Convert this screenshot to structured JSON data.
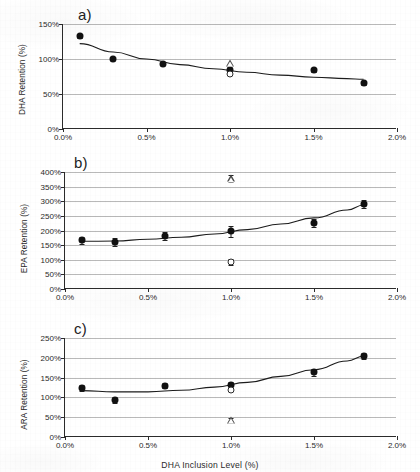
{
  "figure": {
    "xlabel": "DHA Inclusion Level (%)",
    "panel_tags": [
      "a)",
      "b)",
      "c)"
    ]
  },
  "chart_data": [
    {
      "type": "scatter",
      "panel": "a)",
      "title": "",
      "xlabel": "DHA Inclusion Level (%)",
      "ylabel": "DHA Retention (%)",
      "xlim": [
        0,
        2.0
      ],
      "ylim": [
        0,
        150
      ],
      "xticks": [
        0.0,
        0.5,
        1.0,
        1.5,
        2.0
      ],
      "xtick_labels": [
        "0.0%",
        "0.5%",
        "1.0%",
        "1.5%",
        "2.0%"
      ],
      "yticks": [
        0,
        50,
        100,
        150
      ],
      "ytick_labels": [
        "0%",
        "50%",
        "100%",
        "150%"
      ],
      "grid": true,
      "legend": "none",
      "series": [
        {
          "name": "Mean retention (filled circle)",
          "marker": "filled-circle",
          "x": [
            0.1,
            0.3,
            0.6,
            1.0,
            1.5,
            1.8
          ],
          "values": [
            133,
            100,
            93,
            84,
            84,
            66
          ],
          "yerr": [
            3,
            2,
            2,
            4,
            2,
            3
          ]
        },
        {
          "name": "Outlier replicate (open circle)",
          "marker": "open-circle",
          "x": [
            1.0
          ],
          "values": [
            79
          ]
        },
        {
          "name": "Outlier replicate (open triangle)",
          "marker": "open-triangle",
          "x": [
            1.0
          ],
          "values": [
            95
          ]
        }
      ],
      "fit_curve": {
        "name": "fitted trend",
        "x": [
          0.1,
          0.3,
          0.5,
          0.7,
          0.9,
          1.1,
          1.3,
          1.5,
          1.7,
          1.8
        ],
        "y": [
          122,
          110,
          100,
          92,
          86,
          81,
          77,
          74,
          72,
          71
        ]
      }
    },
    {
      "type": "scatter",
      "panel": "b)",
      "title": "",
      "xlabel": "DHA Inclusion Level (%)",
      "ylabel": "EPA Retention (%)",
      "xlim": [
        0,
        2.0
      ],
      "ylim": [
        0,
        400
      ],
      "xticks": [
        0.0,
        0.5,
        1.0,
        1.5,
        2.0
      ],
      "xtick_labels": [
        "0.0%",
        "0.5%",
        "1.0%",
        "1.5%",
        "2.0%"
      ],
      "yticks": [
        0,
        50,
        100,
        150,
        200,
        250,
        300,
        350,
        400
      ],
      "ytick_labels": [
        "0%",
        "50%",
        "100%",
        "150%",
        "200%",
        "250%",
        "300%",
        "350%",
        "400%"
      ],
      "grid": true,
      "legend": "none",
      "series": [
        {
          "name": "Mean retention (filled circle)",
          "marker": "filled-circle",
          "x": [
            0.1,
            0.3,
            0.6,
            1.0,
            1.5,
            1.8
          ],
          "values": [
            166,
            161,
            181,
            197,
            227,
            290
          ],
          "yerr": [
            12,
            13,
            14,
            18,
            14,
            13
          ]
        },
        {
          "name": "Outlier replicate (open circle)",
          "marker": "open-circle",
          "x": [
            1.0
          ],
          "values": [
            92
          ],
          "yerr": [
            10
          ]
        },
        {
          "name": "Outlier replicate (open triangle)",
          "marker": "open-triangle",
          "x": [
            1.0
          ],
          "values": [
            378
          ],
          "yerr": [
            12
          ]
        }
      ],
      "fit_curve": {
        "name": "fitted trend",
        "x": [
          0.1,
          0.3,
          0.5,
          0.7,
          0.9,
          1.1,
          1.3,
          1.5,
          1.7,
          1.8
        ],
        "y": [
          163,
          164,
          170,
          177,
          188,
          203,
          222,
          243,
          270,
          287
        ]
      }
    },
    {
      "type": "scatter",
      "panel": "c)",
      "title": "",
      "xlabel": "DHA Inclusion Level (%)",
      "ylabel": "ARA Retention (%)",
      "xlim": [
        0,
        2.0
      ],
      "ylim": [
        0,
        250
      ],
      "xticks": [
        0.0,
        0.5,
        1.0,
        1.5,
        2.0
      ],
      "xtick_labels": [
        "0.0%",
        "0.5%",
        "1.0%",
        "1.5%",
        "2.0%"
      ],
      "yticks": [
        0,
        50,
        100,
        150,
        200,
        250
      ],
      "ytick_labels": [
        "0%",
        "50%",
        "100%",
        "150%",
        "200%",
        "250%"
      ],
      "grid": true,
      "legend": "none",
      "series": [
        {
          "name": "Mean retention (filled circle)",
          "marker": "filled-circle",
          "x": [
            0.1,
            0.3,
            0.6,
            1.0,
            1.5,
            1.8
          ],
          "values": [
            124,
            93,
            130,
            132,
            163,
            205
          ],
          "yerr": [
            7,
            7,
            6,
            7,
            9,
            8
          ]
        },
        {
          "name": "Outlier replicate (open circle)",
          "marker": "open-circle",
          "x": [
            1.0
          ],
          "values": [
            118
          ]
        },
        {
          "name": "Outlier replicate (open triangle)",
          "marker": "open-triangle",
          "x": [
            1.0
          ],
          "values": [
            43
          ],
          "yerr": [
            6
          ]
        }
      ],
      "fit_curve": {
        "name": "fitted trend",
        "x": [
          0.1,
          0.3,
          0.5,
          0.7,
          0.9,
          1.1,
          1.3,
          1.5,
          1.7,
          1.8
        ],
        "y": [
          117,
          114,
          114,
          118,
          126,
          138,
          153,
          170,
          192,
          204
        ]
      }
    }
  ]
}
